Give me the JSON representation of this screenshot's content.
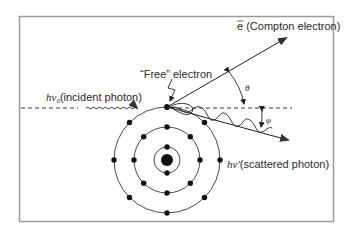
{
  "diagram": {
    "labels": {
      "incident_symbol": "hν",
      "incident_sub": "0",
      "incident_text": "(incident photon)",
      "free_electron": "“Free” electron",
      "compton_symbol": "e",
      "compton_text": " (Compton electron)",
      "scattered_symbol": "hν′",
      "scattered_text": "(scattered photon)",
      "theta": "θ",
      "phi": "φ"
    },
    "colors": {
      "frame": "#9a9a9a",
      "line": "#222222",
      "electron": "#111111",
      "arrowhead": "#333333"
    },
    "atom": {
      "nucleus": 1,
      "shells": [
        {
          "name": "inner",
          "electrons": 2
        },
        {
          "name": "middle",
          "electrons": 8
        },
        {
          "name": "outer",
          "electrons": 8
        }
      ]
    }
  }
}
